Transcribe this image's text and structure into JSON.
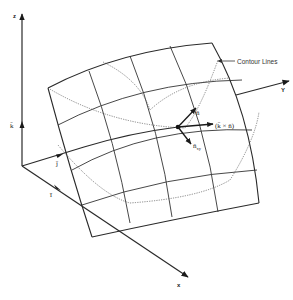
{
  "diagram": {
    "type": "3d-surface-vector-diagram",
    "axes": {
      "z": {
        "label": "z",
        "unit_vector": "k̄"
      },
      "y": {
        "label": "Y",
        "unit_vector": "j̄"
      },
      "x": {
        "label": "x",
        "unit_vector": "ī"
      }
    },
    "vectors": {
      "normal": {
        "label": "n̄"
      },
      "cross": {
        "label": "(k̄ × n̄)"
      },
      "projection": {
        "label": "n̄",
        "subscript": "xy"
      }
    },
    "annotations": {
      "contour_lines": "Contour Lines"
    },
    "colors": {
      "ink": "#2a2a2a",
      "background": "#ffffff",
      "contour": "#555555"
    }
  }
}
